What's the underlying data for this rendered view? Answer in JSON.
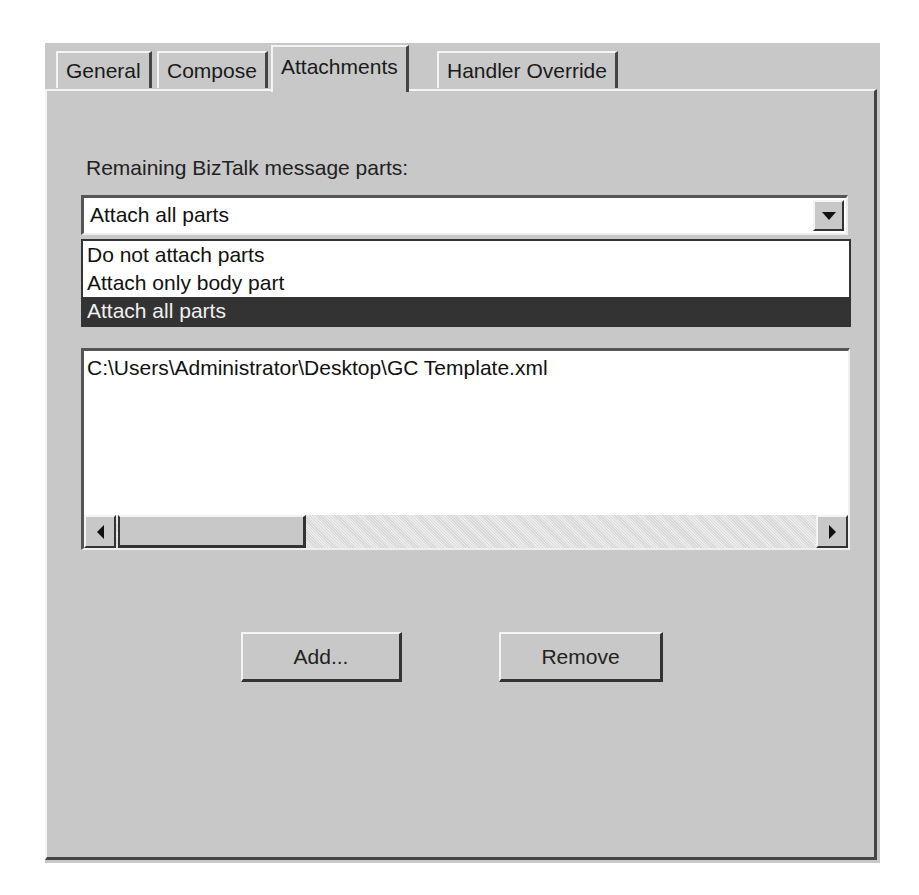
{
  "tabs": [
    {
      "label": "General",
      "active": false
    },
    {
      "label": "Compose",
      "active": false
    },
    {
      "label": "Attachments",
      "active": true
    },
    {
      "label": "Handler Override",
      "active": false
    }
  ],
  "attachments": {
    "parts_label": "Remaining BizTalk message parts:",
    "parts_combo": {
      "selected_value": "Attach all parts",
      "options": [
        {
          "label": "Do not attach parts",
          "selected": false
        },
        {
          "label": "Attach only body part",
          "selected": false
        },
        {
          "label": "Attach all parts",
          "selected": true
        }
      ]
    },
    "files_list": {
      "items": [
        "C:\\Users\\Administrator\\Desktop\\GC Template.xml"
      ]
    },
    "buttons": {
      "add_label": "Add...",
      "remove_label": "Remove"
    }
  },
  "icons": {
    "combo_arrow": "triangle-down",
    "scroll_left": "triangle-left",
    "scroll_right": "triangle-right"
  },
  "colors": {
    "dialog_bg": "#c8c8c8",
    "selection_bg": "#333333",
    "field_bg": "#ffffff"
  }
}
